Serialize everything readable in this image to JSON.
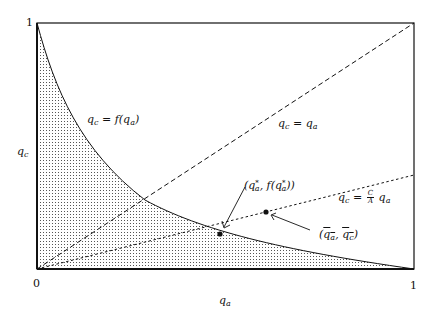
{
  "diagram": {
    "axes": {
      "x_label_base": "q",
      "x_label_sub": "a",
      "y_label_base": "q",
      "y_label_sub": "c",
      "x_tick_min": "0",
      "x_tick_max": "1",
      "y_tick_max": "1",
      "range": [
        0,
        1
      ]
    },
    "curves": [
      {
        "id": "f",
        "style": "solid",
        "label_lhs": "q",
        "label_lhs_sub": "c",
        "label_eq": " = f(",
        "label_arg": "q",
        "label_arg_sub": "a",
        "label_close": ")",
        "shaded_below": true
      },
      {
        "id": "diagonal",
        "style": "dashed",
        "label_lhs": "q",
        "label_lhs_sub": "c",
        "label_eq": " = ",
        "label_rhs": "q",
        "label_rhs_sub": "a"
      },
      {
        "id": "ratio",
        "style": "dotted",
        "label_lhs": "q",
        "label_lhs_sub": "c",
        "label_eq": " = ",
        "frac_num": "C",
        "frac_den": "A",
        "label_rhs": "q",
        "label_rhs_sub": "a"
      }
    ],
    "points": [
      {
        "id": "optimum",
        "label_open": "(",
        "label_q": "q",
        "label_sub": "a",
        "label_sup": "*",
        "label_mid": ", f(",
        "label_q2": "q",
        "label_sub2": "a",
        "label_sup2": "*",
        "label_close": "))"
      },
      {
        "id": "bar",
        "label_open": "(",
        "label_q": "q",
        "label_sub": "a",
        "label_comma": ", ",
        "label_q2": "q",
        "label_sub2": "c",
        "label_close": ")"
      }
    ],
    "colors": {
      "ink": "#111111",
      "background": "#ffffff",
      "shading": "#555555"
    }
  }
}
